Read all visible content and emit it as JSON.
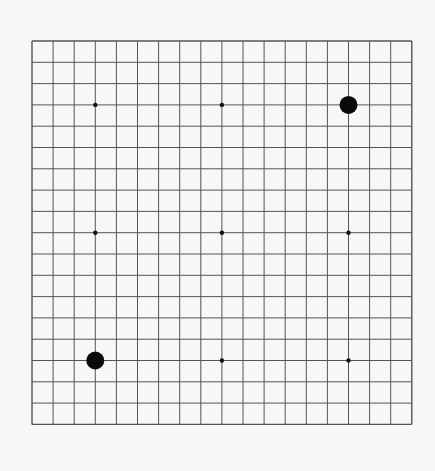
{
  "board": {
    "size": 19,
    "origin": [
      32,
      41
    ],
    "spacing": [
      21.1,
      21.3
    ],
    "line_color": "#555555",
    "background": "#f7f7f5",
    "star_points": [
      [
        3,
        3
      ],
      [
        9,
        3
      ],
      [
        15,
        3
      ],
      [
        3,
        9
      ],
      [
        9,
        9
      ],
      [
        15,
        9
      ],
      [
        3,
        15
      ],
      [
        9,
        15
      ],
      [
        15,
        15
      ]
    ],
    "stones": [
      {
        "col": 15,
        "row": 3,
        "color": "black"
      },
      {
        "col": 3,
        "row": 15,
        "color": "black"
      }
    ]
  }
}
